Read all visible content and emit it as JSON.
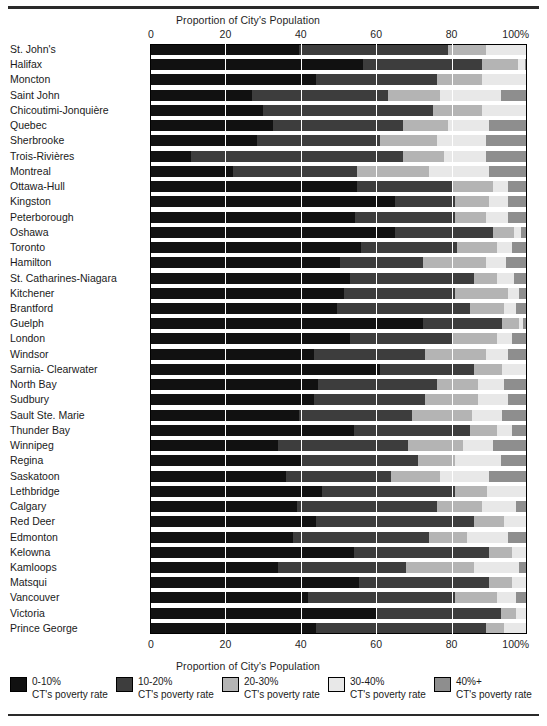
{
  "axis": {
    "title_top": "Proportion of City's Population",
    "title_bottom": "Proportion of City's Population",
    "ticks": [
      "0",
      "20",
      "40",
      "60",
      "80",
      "100%"
    ],
    "tick_values": [
      0,
      20,
      40,
      60,
      80,
      100
    ]
  },
  "legend": {
    "items": [
      {
        "label": "0-10%",
        "sublabel": "CT's poverty rate",
        "color": "#111111",
        "name": "legend-swatch-0-10"
      },
      {
        "label": "10-20%",
        "sublabel": "CT's poverty rate",
        "color": "#3d3d3d",
        "name": "legend-swatch-10-20"
      },
      {
        "label": "20-30%",
        "sublabel": "CT's poverty rate",
        "color": "#b4b4b4",
        "name": "legend-swatch-20-30"
      },
      {
        "label": "30-40%",
        "sublabel": "CT's poverty rate",
        "color": "#e8e8e8",
        "name": "legend-swatch-30-40"
      },
      {
        "label": "40%+",
        "sublabel": "CT's poverty rate",
        "color": "#8e8e8e",
        "name": "legend-swatch-40-plus"
      }
    ]
  },
  "chart_data": {
    "type": "bar",
    "orientation": "horizontal",
    "stacked": true,
    "normalized": true,
    "title": "",
    "xlabel": "Proportion of City's Population",
    "ylabel": "",
    "xlim": [
      0,
      100
    ],
    "xticks": [
      0,
      20,
      40,
      60,
      80,
      100
    ],
    "grid": true,
    "legend_position": "bottom",
    "series": [
      {
        "name": "0-10% CT's poverty rate",
        "color": "#111111"
      },
      {
        "name": "10-20% CT's poverty rate",
        "color": "#3d3d3d"
      },
      {
        "name": "20-30% CT's poverty rate",
        "color": "#b4b4b4"
      },
      {
        "name": "30-40% CT's poverty rate",
        "color": "#e8e8e8"
      },
      {
        "name": "40%+ CT's poverty rate",
        "color": "#8e8e8e"
      }
    ],
    "categories": [
      "St. John's",
      "Halifax",
      "Moncton",
      "Saint John",
      "Chicoutimi-Jonquière",
      "Quebec",
      "Sherbrooke",
      "Trois-Rivières",
      "Montreal",
      "Ottawa-Hull",
      "Kingston",
      "Peterborough",
      "Oshawa",
      "Toronto",
      "Hamilton",
      "St. Catharines-Niagara",
      "Kitchener",
      "Brantford",
      "Guelph",
      "London",
      "Windsor",
      "Sarnia- Clearwater",
      "North Bay",
      "Sudbury",
      "Sault Ste. Marie",
      "Thunder Bay",
      "Winnipeg",
      "Regina",
      "Saskatoon",
      "Lethbridge",
      "Calgary",
      "Red Deer",
      "Edmonton",
      "Kelowna",
      "Kamloops",
      "Matsqui",
      "Vancouver",
      "Victoria",
      "Prince George"
    ],
    "rows": [
      {
        "city": "St. John's",
        "values": [
          39.5,
          39.5,
          10.0,
          11.0,
          0.0
        ]
      },
      {
        "city": "Halifax",
        "values": [
          56.5,
          31.5,
          9.5,
          2.0,
          0.5
        ]
      },
      {
        "city": "Moncton",
        "values": [
          44.0,
          32.0,
          12.0,
          12.0,
          0.0
        ]
      },
      {
        "city": "Saint John",
        "values": [
          27.0,
          36.0,
          14.0,
          16.0,
          7.0
        ]
      },
      {
        "city": "Chicoutimi-Jonquière",
        "values": [
          30.0,
          45.0,
          13.0,
          12.0,
          0.0
        ]
      },
      {
        "city": "Quebec",
        "values": [
          32.5,
          34.5,
          12.0,
          11.0,
          10.0
        ]
      },
      {
        "city": "Sherbrooke",
        "values": [
          28.5,
          32.5,
          15.0,
          13.0,
          11.0
        ]
      },
      {
        "city": "Trois-Rivières",
        "values": [
          11.0,
          56.0,
          11.0,
          11.0,
          11.0
        ]
      },
      {
        "city": "Montreal",
        "values": [
          22.0,
          33.0,
          19.0,
          16.0,
          10.0
        ]
      },
      {
        "city": "Ottawa-Hull",
        "values": [
          55.0,
          25.0,
          11.0,
          4.0,
          5.0
        ]
      },
      {
        "city": "Kingston",
        "values": [
          65.0,
          16.0,
          9.0,
          5.0,
          5.0
        ]
      },
      {
        "city": "Peterborough",
        "values": [
          54.5,
          26.5,
          8.0,
          6.0,
          5.0
        ]
      },
      {
        "city": "Oshawa",
        "values": [
          65.0,
          26.0,
          5.5,
          2.0,
          1.5
        ]
      },
      {
        "city": "Toronto",
        "values": [
          56.0,
          25.5,
          10.5,
          4.0,
          4.0
        ]
      },
      {
        "city": "Hamilton",
        "values": [
          50.5,
          22.0,
          16.5,
          5.5,
          5.5
        ]
      },
      {
        "city": "St. Catharines-Niagara",
        "values": [
          53.0,
          33.0,
          6.0,
          4.5,
          3.5
        ]
      },
      {
        "city": "Kitchener",
        "values": [
          51.5,
          29.5,
          14.0,
          3.0,
          2.0
        ]
      },
      {
        "city": "Brantford",
        "values": [
          49.5,
          35.5,
          9.0,
          3.0,
          3.0
        ]
      },
      {
        "city": "Guelph",
        "values": [
          72.5,
          21.0,
          4.5,
          1.0,
          1.0
        ]
      },
      {
        "city": "London",
        "values": [
          53.0,
          27.0,
          12.0,
          4.0,
          4.0
        ]
      },
      {
        "city": "Windsor",
        "values": [
          43.5,
          29.5,
          16.0,
          6.0,
          5.0
        ]
      },
      {
        "city": "Sarnia- Clearwater",
        "values": [
          61.0,
          25.0,
          7.5,
          6.5,
          0.0
        ]
      },
      {
        "city": "North Bay",
        "values": [
          44.5,
          31.5,
          11.0,
          7.0,
          6.0
        ]
      },
      {
        "city": "Sudbury",
        "values": [
          43.5,
          29.5,
          14.0,
          8.0,
          5.0
        ]
      },
      {
        "city": "Sault Ste. Marie",
        "values": [
          39.5,
          30.0,
          16.0,
          8.0,
          6.5
        ]
      },
      {
        "city": "Thunder Bay",
        "values": [
          54.0,
          31.0,
          7.0,
          4.0,
          4.0
        ]
      },
      {
        "city": "Winnipeg",
        "values": [
          34.0,
          34.5,
          14.5,
          8.0,
          9.0
        ]
      },
      {
        "city": "Regina",
        "values": [
          40.0,
          31.0,
          10.0,
          12.0,
          7.0
        ]
      },
      {
        "city": "Saskatoon",
        "values": [
          36.0,
          28.0,
          13.0,
          13.0,
          10.0
        ]
      },
      {
        "city": "Lethbridge",
        "values": [
          45.5,
          35.5,
          8.5,
          10.5,
          0.0
        ]
      },
      {
        "city": "Calgary",
        "values": [
          39.0,
          37.0,
          12.0,
          9.0,
          3.0
        ]
      },
      {
        "city": "Red Deer",
        "values": [
          44.0,
          42.0,
          8.0,
          6.0,
          0.0
        ]
      },
      {
        "city": "Edmonton",
        "values": [
          38.0,
          36.0,
          10.0,
          11.0,
          5.0
        ]
      },
      {
        "city": "Kelowna",
        "values": [
          54.0,
          36.0,
          6.0,
          4.0,
          0.0
        ]
      },
      {
        "city": "Kamloops",
        "values": [
          34.0,
          34.0,
          18.0,
          12.0,
          2.0
        ]
      },
      {
        "city": "Matsqui",
        "values": [
          55.5,
          34.5,
          6.0,
          4.0,
          0.0
        ]
      },
      {
        "city": "Vancouver",
        "values": [
          42.0,
          39.0,
          11.0,
          5.0,
          3.0
        ]
      },
      {
        "city": "Victoria",
        "values": [
          60.0,
          33.0,
          4.0,
          3.0,
          0.0
        ]
      },
      {
        "city": "Prince George",
        "values": [
          44.0,
          45.0,
          5.0,
          6.0,
          0.0
        ]
      }
    ]
  }
}
